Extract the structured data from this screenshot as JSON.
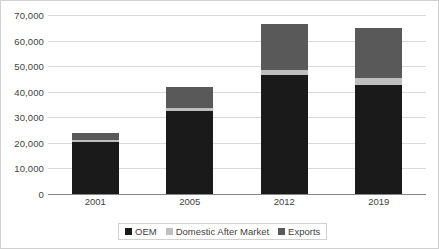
{
  "chart_data": {
    "type": "bar",
    "stacked": true,
    "title": "",
    "xlabel": "",
    "ylabel": "",
    "categories": [
      "2001",
      "2005",
      "2012",
      "2019"
    ],
    "series": [
      {
        "name": "OEM",
        "color": "#1a1a1a",
        "values": [
          20500,
          32500,
          46500,
          42500
        ]
      },
      {
        "name": "Domestic After Market",
        "color": "#bfbfbf",
        "values": [
          800,
          1200,
          2000,
          3000
        ]
      },
      {
        "name": "Exports",
        "color": "#595959",
        "values": [
          2700,
          8300,
          18000,
          19500
        ]
      }
    ],
    "totals": [
      24000,
      42000,
      66500,
      65000
    ],
    "ylim": [
      0,
      70000
    ],
    "ytick_values": [
      0,
      10000,
      20000,
      30000,
      40000,
      50000,
      60000,
      70000
    ],
    "ytick_labels": [
      "0",
      "10,000",
      "20,000",
      "30,000",
      "40,000",
      "50,000",
      "60,000",
      "70,000"
    ],
    "grid": true,
    "legend_position": "bottom"
  }
}
